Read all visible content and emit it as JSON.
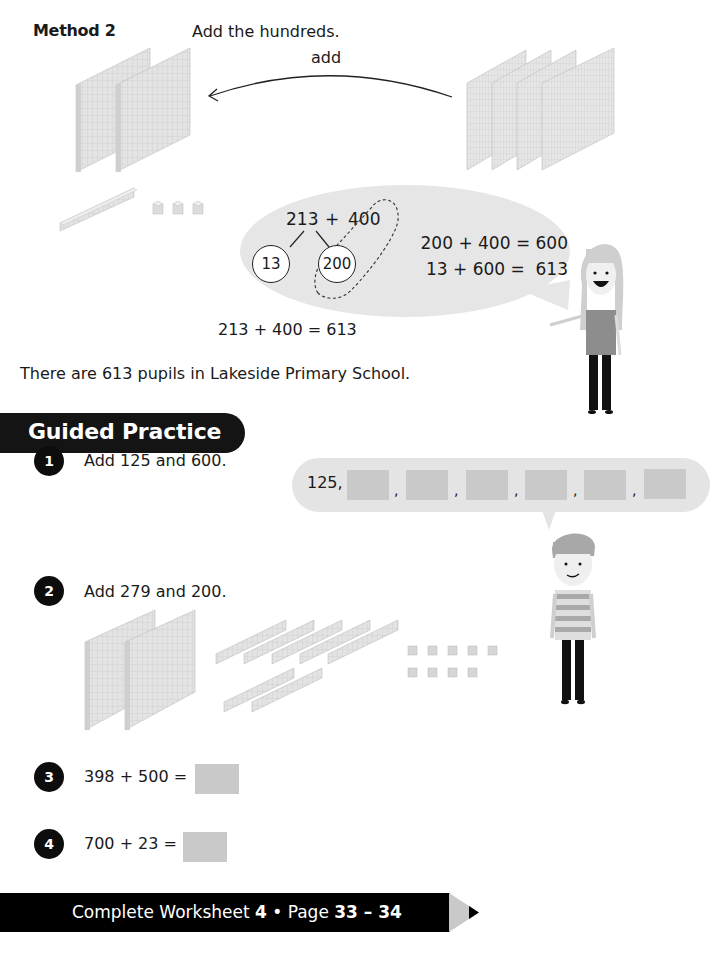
{
  "method": {
    "label": "Method 2",
    "instruction": "Add the hundreds.",
    "arrow_label": "add",
    "left_blocks": {
      "hundreds": 2,
      "tens": 1,
      "ones": 3
    },
    "right_blocks": {
      "hundreds": 4
    }
  },
  "bubble": {
    "expression_a": "213",
    "plus": "+",
    "expression_b": "400",
    "split_ones": "13",
    "split_hundreds": "200",
    "line1": "200 + 400 = 600",
    "line2": "13 + 600 =  613"
  },
  "result": {
    "equation": "213 + 400 = 613",
    "sentence": "There are 613 pupils in Lakeside Primary School."
  },
  "guided_practice": {
    "title": "Guided Practice",
    "questions": [
      {
        "number": "1",
        "text": "Add 125 and 600."
      },
      {
        "number": "2",
        "text": "Add 279 and 200."
      },
      {
        "number": "3",
        "text": "398 + 500 ="
      },
      {
        "number": "4",
        "text": "700 + 23 ="
      }
    ],
    "counting_bubble": {
      "start": "125,",
      "blanks": 6,
      "separator": ","
    },
    "q2_blocks": {
      "hundreds": 2,
      "tens": 7,
      "ones": 9
    }
  },
  "footer": {
    "prefix": "Complete Worksheet ",
    "worksheet": "4",
    "middle": " • Page ",
    "pages": "33 – 34"
  },
  "colors": {
    "banner": "#141414",
    "bubble": "#e4e4e4",
    "blank": "#c9c9c9",
    "block": "#d8d8d8"
  }
}
